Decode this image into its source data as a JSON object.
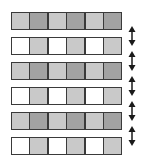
{
  "colors": {
    "white": "#ffffff",
    "light": "#c9c9c9",
    "dark": "#a2a2a2",
    "border": "#3a3a3a",
    "arrow": "#1a1a1a"
  },
  "rows": [
    {
      "cells": [
        "light",
        "dark",
        "light",
        "dark",
        "light",
        "dark"
      ]
    },
    {
      "cells": [
        "white",
        "light",
        "white",
        "light",
        "white",
        "light"
      ]
    },
    {
      "cells": [
        "light",
        "dark",
        "light",
        "dark",
        "light",
        "dark"
      ]
    },
    {
      "cells": [
        "white",
        "light",
        "white",
        "light",
        "white",
        "light"
      ]
    },
    {
      "cells": [
        "light",
        "dark",
        "light",
        "dark",
        "light",
        "dark"
      ]
    },
    {
      "cells": [
        "white",
        "light",
        "white",
        "light",
        "white",
        "light"
      ]
    }
  ],
  "arrows": [
    {
      "icon": "double-arrow-vertical-icon",
      "between": [
        1,
        2
      ]
    },
    {
      "icon": "double-arrow-vertical-icon",
      "between": [
        2,
        3
      ]
    },
    {
      "icon": "double-arrow-vertical-icon",
      "between": [
        3,
        4
      ]
    },
    {
      "icon": "double-arrow-vertical-icon",
      "between": [
        4,
        5
      ]
    },
    {
      "icon": "double-arrow-vertical-icon",
      "between": [
        5,
        6
      ]
    }
  ]
}
